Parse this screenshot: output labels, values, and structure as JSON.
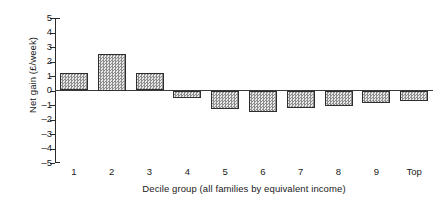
{
  "chart_data": {
    "type": "bar",
    "title": "",
    "subtitle": "",
    "xlabel": "Decile group (all families by equivalent income)",
    "ylabel": "Net gain (£/week)",
    "categories": [
      "1",
      "2",
      "3",
      "4",
      "5",
      "6",
      "7",
      "8",
      "9",
      "Top"
    ],
    "values": [
      1.2,
      2.5,
      1.2,
      -0.5,
      -1.3,
      -1.5,
      -1.2,
      -1.05,
      -0.85,
      -0.75
    ],
    "series": [
      {
        "name": "Net gain",
        "values": [
          1.2,
          2.5,
          1.2,
          -0.5,
          -1.3,
          -1.5,
          -1.2,
          -1.05,
          -0.85,
          -0.75
        ]
      }
    ],
    "ylim": [
      -5,
      5
    ],
    "ytick_labels": [
      "5",
      "4",
      "3",
      "2",
      "1",
      "0",
      "–1",
      "–2",
      "–3",
      "–4",
      "–5"
    ],
    "ytick_values": [
      5,
      4,
      3,
      2,
      1,
      0,
      -1,
      -2,
      -3,
      -4,
      -5
    ],
    "grid": false,
    "legend": false,
    "legend_position": "none",
    "bar_fill_color": "#cfcfcf",
    "bar_border_color": "#2e2e2e",
    "axis_color": "#2b2b2b",
    "zero_line_value": 0
  }
}
